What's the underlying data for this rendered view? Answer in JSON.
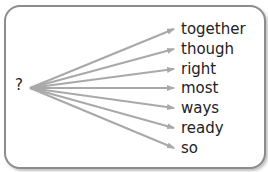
{
  "diagram": {
    "source_label": "?",
    "arrow_color": "#a9a9a9",
    "border_color": "#8c8c8c",
    "targets": [
      {
        "label": "together",
        "y": 29
      },
      {
        "label": "though",
        "y": 49
      },
      {
        "label": "right",
        "y": 69
      },
      {
        "label": "most",
        "y": 88
      },
      {
        "label": "ways",
        "y": 108
      },
      {
        "label": "ready",
        "y": 128
      },
      {
        "label": "so",
        "y": 148
      }
    ]
  }
}
